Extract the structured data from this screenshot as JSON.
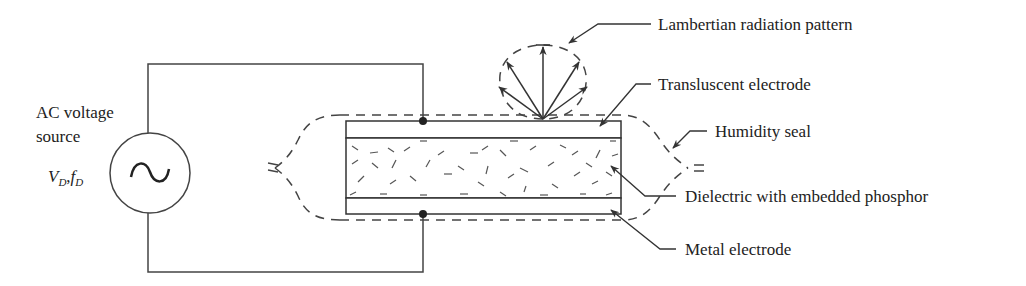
{
  "diagram": {
    "source": {
      "label_line1": "AC voltage",
      "label_line2": "source",
      "symbol": "~",
      "voltage_var": "V",
      "voltage_sub": "D",
      "separator": ",",
      "freq_var": "f",
      "freq_sub": "D"
    },
    "labels": {
      "lambertian": "Lambertian radiation pattern",
      "translucent": "Transluscent electrode",
      "humidity": "Humidity seal",
      "dielectric": "Dielectric with embedded phosphor",
      "metal": "Metal electrode"
    },
    "layers": [
      "Transluscent electrode",
      "Dielectric with embedded phosphor",
      "Metal electrode"
    ],
    "colors": {
      "line": "#333333",
      "text": "#222222",
      "background": "#ffffff"
    }
  }
}
